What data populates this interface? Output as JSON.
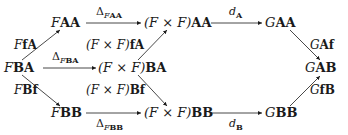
{
  "diagram": {
    "type": "commutative-diagram",
    "nodes": {
      "FAA": {
        "pre": "F",
        "obj": "AA"
      },
      "FxFAA": {
        "pre": "(F × F)",
        "obj": "AA"
      },
      "GAA": {
        "pre": "G",
        "obj": "AA"
      },
      "FBA": {
        "pre": "F",
        "obj": "BA"
      },
      "FxFBA": {
        "pre": "(F × F)",
        "obj": "BA"
      },
      "GAB": {
        "pre": "G",
        "obj": "AB"
      },
      "FBB": {
        "pre": "F",
        "obj": "BB"
      },
      "FxFBB": {
        "pre": "(F × F)",
        "obj": "BB"
      },
      "GBB": {
        "pre": "G",
        "obj": "BB"
      }
    },
    "edge_labels": {
      "delta_FAA": {
        "sym": "Δ",
        "sub_i": "F",
        "sub_b": "AA"
      },
      "d_A": {
        "sym": "d",
        "sub_b": "A"
      },
      "FfA": {
        "pre": "F",
        "obj": "fA"
      },
      "FxFfA": {
        "pre": "(F × F)",
        "obj": "fA"
      },
      "delta_FBA": {
        "sym": "Δ",
        "sub_i": "F",
        "sub_b": "BA"
      },
      "GAf": {
        "pre": "G",
        "obj": "Af"
      },
      "FBf": {
        "pre": "F",
        "obj": "Bf"
      },
      "FxFBf": {
        "pre": "(F × F)",
        "obj": "Bf"
      },
      "GfB": {
        "pre": "G",
        "obj": "fB"
      },
      "delta_FBB": {
        "sym": "Δ",
        "sub_i": "F",
        "sub_b": "BB"
      },
      "d_B": {
        "sym": "d",
        "sub_b": "B"
      }
    },
    "edges": [
      {
        "from": "FBA",
        "to": "FAA",
        "label": "FfA"
      },
      {
        "from": "FBA",
        "to": "FxFBA",
        "label": "delta_FBA"
      },
      {
        "from": "FBA",
        "to": "FBB",
        "label": "FBf"
      },
      {
        "from": "FAA",
        "to": "FxFAA",
        "label": "delta_FAA"
      },
      {
        "from": "FxFBA",
        "to": "FxFAA",
        "label": "FxFfA"
      },
      {
        "from": "FxFBA",
        "to": "FxFBB",
        "label": "FxFBf"
      },
      {
        "from": "FBB",
        "to": "FxFBB",
        "label": "delta_FBB"
      },
      {
        "from": "FxFAA",
        "to": "GAA",
        "label": "d_A"
      },
      {
        "from": "FxFBB",
        "to": "GBB",
        "label": "d_B"
      },
      {
        "from": "GAA",
        "to": "GAB",
        "label": "GAf"
      },
      {
        "from": "GBB",
        "to": "GAB",
        "label": "GfB"
      }
    ],
    "colors": {
      "ink": "#1a1a1a",
      "background": "#ffffff"
    }
  }
}
